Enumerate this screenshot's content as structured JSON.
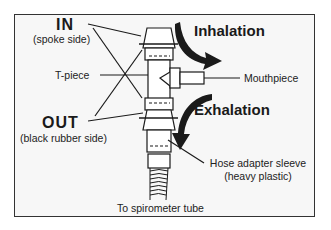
{
  "diagram": {
    "type": "labeled-apparatus-diagram",
    "labels": {
      "in_title": "IN",
      "in_subtitle": "(spoke side)",
      "t_piece": "T-piece",
      "out_title": "OUT",
      "out_subtitle": "(black rubber side)",
      "inhalation": "Inhalation",
      "exhalation": "Exhalation",
      "mouthpiece": "Mouthpiece",
      "hose_adapter_line1": "Hose adapter sleeve",
      "hose_adapter_line2": "(heavy plastic)",
      "spirometer_tube": "To spirometer tube"
    },
    "arrows": [
      {
        "name": "inhalation-arrow",
        "direction": "curving down-right toward T-piece"
      },
      {
        "name": "exhalation-arrow",
        "direction": "curving down along tube"
      }
    ],
    "colors": {
      "line": "#1a1a1a",
      "background": "#f7f7f7",
      "frame": "#333333"
    }
  }
}
